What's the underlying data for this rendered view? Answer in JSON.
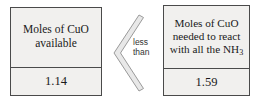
{
  "diagram": {
    "type": "comparison",
    "left_box": {
      "label_lines": [
        "Moles of",
        "CuO",
        "available"
      ],
      "label_text": "Moles of CuO available",
      "value": "1.14"
    },
    "right_box": {
      "label_lines": [
        "Moles of CuO",
        "needed to",
        "react with",
        "all the NH"
      ],
      "label_text": "Moles of CuO needed to react with all the NH3",
      "formula_subscript": "3",
      "value": "1.59"
    },
    "comparator": {
      "symbol": "<",
      "label": "less\nthan",
      "icon": "less-than-chevron-icon"
    },
    "colors": {
      "box_fill": "#f1f0ee",
      "box_border": "#4a4a4a",
      "text": "#1a1a1a",
      "comparator_stroke": "#8c8c8c",
      "comparator_fill": "#e8e8e8",
      "comparator_label": "#333333",
      "background": "#ffffff"
    }
  }
}
